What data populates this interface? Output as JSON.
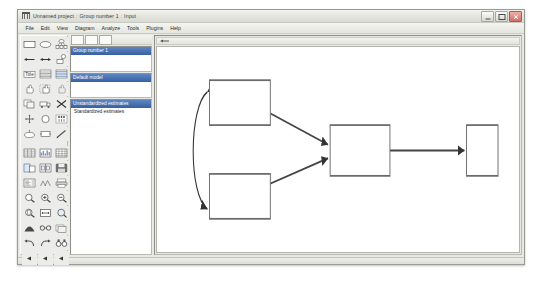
{
  "window": {
    "title_parts": [
      "Unnamed project",
      "Group number 1",
      "Input"
    ],
    "separator": ":",
    "app_icon": "amos-icon",
    "buttons": {
      "minimize": "Minimize",
      "maximize": "Maximize",
      "close": "Close"
    }
  },
  "menu": {
    "items": [
      {
        "label": "File"
      },
      {
        "label": "Edit"
      },
      {
        "label": "View"
      },
      {
        "label": "Diagram"
      },
      {
        "label": "Analyze"
      },
      {
        "label": "Tools"
      },
      {
        "label": "Plugins"
      },
      {
        "label": "Help"
      }
    ]
  },
  "toolbox": {
    "tools": [
      {
        "name": "draw-observed-variable",
        "icon": "rectangle-icon"
      },
      {
        "name": "draw-unobserved-variable",
        "icon": "ellipse-icon"
      },
      {
        "name": "draw-latent-with-indicators",
        "icon": "latent-indicators-icon"
      },
      {
        "name": "draw-path",
        "icon": "single-arrow-icon"
      },
      {
        "name": "draw-covariance",
        "icon": "double-arrow-icon"
      },
      {
        "name": "add-unique-variable",
        "icon": "error-term-icon"
      },
      {
        "name": "figure-caption",
        "icon": "title-icon"
      },
      {
        "name": "list-variables-in-model",
        "icon": "list-model-vars-icon"
      },
      {
        "name": "list-variables-in-dataset",
        "icon": "list-dataset-vars-icon"
      },
      {
        "name": "select-one-object",
        "icon": "hand-pointer-icon"
      },
      {
        "name": "select-all-objects",
        "icon": "hand-all-icon"
      },
      {
        "name": "deselect-all-objects",
        "icon": "hand-none-icon"
      },
      {
        "name": "duplicate-objects",
        "icon": "copy-icon"
      },
      {
        "name": "move-objects",
        "icon": "move-truck-icon"
      },
      {
        "name": "erase-objects",
        "icon": "erase-x-icon"
      },
      {
        "name": "change-shape-of-objects",
        "icon": "resize-icon"
      },
      {
        "name": "rotate-indicators",
        "icon": "rotate-circle-icon"
      },
      {
        "name": "reflect-indicators",
        "icon": "reflect-icon"
      },
      {
        "name": "move-parameter-values",
        "icon": "move-parameter-icon"
      },
      {
        "name": "scroll-diagram",
        "icon": "scroll-icon"
      },
      {
        "name": "touch-up-variable",
        "icon": "touch-up-icon"
      },
      {
        "name": "select-data-file",
        "icon": "data-file-icon"
      },
      {
        "name": "analysis-properties",
        "icon": "analysis-properties-icon"
      },
      {
        "name": "object-properties",
        "icon": "object-properties-icon"
      },
      {
        "name": "drag-properties",
        "icon": "drag-properties-icon"
      },
      {
        "name": "preserve-symmetries",
        "icon": "symmetry-icon"
      },
      {
        "name": "save-diagram",
        "icon": "save-icon"
      },
      {
        "name": "view-text-output",
        "icon": "text-output-icon"
      },
      {
        "name": "multiple-group-analysis",
        "icon": "multi-group-icon"
      },
      {
        "name": "print-diagram",
        "icon": "print-icon"
      },
      {
        "name": "zoom-select-area",
        "icon": "zoom-area-icon"
      },
      {
        "name": "zoom-in",
        "icon": "zoom-in-icon"
      },
      {
        "name": "zoom-out",
        "icon": "zoom-out-icon"
      },
      {
        "name": "zoom-page",
        "icon": "zoom-page-icon"
      },
      {
        "name": "fit-to-page",
        "icon": "fit-page-icon"
      },
      {
        "name": "loupe",
        "icon": "loupe-icon"
      },
      {
        "name": "bayesian-estimation",
        "icon": "bayesian-icon"
      },
      {
        "name": "multiple-group-glasses",
        "icon": "glasses-icon"
      },
      {
        "name": "print-preview",
        "icon": "preview-icon"
      },
      {
        "name": "undo",
        "icon": "undo-icon"
      },
      {
        "name": "redo",
        "icon": "redo-icon"
      },
      {
        "name": "search",
        "icon": "binoculars-icon"
      },
      {
        "name": "scroll-left-1",
        "icon": "triangle-left-icon"
      },
      {
        "name": "scroll-left-2",
        "icon": "triangle-left-icon"
      },
      {
        "name": "scroll-left-3",
        "icon": "triangle-left-icon"
      }
    ]
  },
  "panels": {
    "group": {
      "header": "Group number 1",
      "rows": []
    },
    "model": {
      "header": "Default model",
      "rows": []
    },
    "view": {
      "header": "Unstandardized estimates",
      "rows": [
        {
          "label": "Standardized estimates",
          "selected": false
        }
      ]
    }
  },
  "canvas": {
    "toolstrip_icon": "path-arrow-icon",
    "diagram": {
      "type": "path-diagram",
      "nodes": [
        {
          "id": "n1",
          "name": "observed-variable-top-left",
          "label": "",
          "x": 50,
          "y": 17,
          "w": 58,
          "h": 23
        },
        {
          "id": "n2",
          "name": "observed-variable-bottom-left",
          "label": "",
          "x": 50,
          "y": 65,
          "w": 58,
          "h": 23
        },
        {
          "id": "n3",
          "name": "observed-variable-middle",
          "label": "",
          "x": 165,
          "y": 40,
          "w": 57,
          "h": 26
        },
        {
          "id": "n4",
          "name": "observed-variable-right",
          "label": "",
          "x": 295,
          "y": 40,
          "w": 30,
          "h": 26
        }
      ],
      "paths": [
        {
          "name": "path-n1-to-n3",
          "from": "n1",
          "to": "n3",
          "label": ""
        },
        {
          "name": "path-n2-to-n3",
          "from": "n2",
          "to": "n3",
          "label": ""
        },
        {
          "name": "path-n3-to-n4",
          "from": "n3",
          "to": "n4",
          "label": ""
        }
      ],
      "covariances": [
        {
          "name": "covariance-n1-n2",
          "between": [
            "n1",
            "n2"
          ],
          "label": ""
        }
      ]
    }
  }
}
